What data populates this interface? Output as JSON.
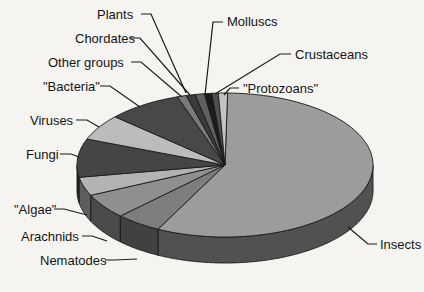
{
  "figure": {
    "kind": "3d-pie-chart-figure",
    "background": "#f5f4f1",
    "line_color": "#1a1a1a"
  },
  "chart_data": {
    "type": "pie",
    "style": "3d-oblique",
    "title": "",
    "legend_position": "callout-labels",
    "start_angle_deg": 89,
    "direction": "clockwise",
    "values_are": "percent-estimated-from-wedge-angles",
    "slices": [
      {
        "label": "Insects",
        "value": 57.2,
        "color": "#9c9c9c"
      },
      {
        "label": "Nematodes",
        "value": 5.0,
        "color": "#7d7d7d"
      },
      {
        "label": "Arachnids",
        "value": 5.6,
        "color": "#8f8f8f"
      },
      {
        "label": "\"Algae\"",
        "value": 4.2,
        "color": "#b3b3b3"
      },
      {
        "label": "Fungi",
        "value": 8.6,
        "color": "#454545"
      },
      {
        "label": "Viruses",
        "value": 5.8,
        "color": "#bcbcbc"
      },
      {
        "label": "\"Bacteria\"",
        "value": 8.1,
        "color": "#484848"
      },
      {
        "label": "Other groups",
        "value": 1.0,
        "color": "#7a7a7a"
      },
      {
        "label": "Chordates",
        "value": 1.0,
        "color": "#3a3a3a"
      },
      {
        "label": "Plants",
        "value": 1.0,
        "color": "#606060"
      },
      {
        "label": "Molluscs",
        "value": 0.8,
        "color": "#1c1c1c"
      },
      {
        "label": "Crustaceans",
        "value": 0.7,
        "color": "#505050"
      },
      {
        "label": "\"Protozoans\"",
        "value": 1.0,
        "color": "#c4c4c4"
      }
    ]
  }
}
